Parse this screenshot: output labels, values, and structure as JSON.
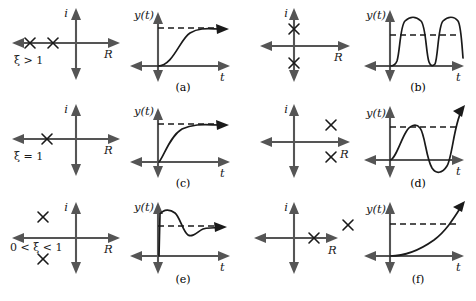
{
  "figure": {
    "axis_labels": {
      "real": "R",
      "imaginary": "i",
      "output": "y(t)",
      "time": "t"
    },
    "colors": {
      "axis": "#555555",
      "curve": "#1a1a1a",
      "text": "#1a1a1a",
      "background": "#ffffff"
    },
    "pole_glyph": "x"
  },
  "panels": [
    {
      "id": "a",
      "caption": "(a)",
      "damping_label": "ξ > 1",
      "damping_condition": "overdamped",
      "row": 0,
      "column": 0,
      "poles": {
        "description": "two distinct real poles on the negative real axis",
        "count": 2,
        "points": [
          {
            "real": -0.82,
            "imag": 0.0
          },
          {
            "real": -0.45,
            "imag": 0.0
          }
        ]
      },
      "response": {
        "description": "non-oscillatory exponential rise to the steady state value",
        "type": "overdamped-step",
        "overshoot": false,
        "reference_line": true,
        "final_value": 1.0
      }
    },
    {
      "id": "b",
      "caption": "(b)",
      "damping_label": "",
      "damping_condition": "undamped",
      "row": 0,
      "column": 1,
      "poles": {
        "description": "complex conjugate pair located on the imaginary axis",
        "count": 2,
        "points": [
          {
            "real": 0.0,
            "imag": 0.5
          },
          {
            "real": 0.0,
            "imag": -0.5
          }
        ]
      },
      "response": {
        "description": "sustained oscillation of constant amplitude about the reference level",
        "type": "undamped-oscillation",
        "overshoot": true,
        "reference_line": true,
        "final_value": 1.0
      }
    },
    {
      "id": "c",
      "caption": "(c)",
      "damping_label": "ξ = 1",
      "damping_condition": "critically damped",
      "row": 1,
      "column": 0,
      "poles": {
        "description": "repeated real pole on the negative real axis",
        "count": 1,
        "points": [
          {
            "real": -0.55,
            "imag": 0.0
          }
        ]
      },
      "response": {
        "description": "fastest non-oscillatory rise to the steady state value",
        "type": "critically-damped-step",
        "overshoot": false,
        "reference_line": true,
        "final_value": 1.0
      }
    },
    {
      "id": "d",
      "caption": "(d)",
      "damping_label": "",
      "damping_condition": "unstable oscillatory",
      "row": 1,
      "column": 1,
      "poles": {
        "description": "complex conjugate pair in the right half plane",
        "count": 2,
        "points": [
          {
            "real": 0.55,
            "imag": 0.45
          },
          {
            "real": 0.55,
            "imag": -0.45
          }
        ]
      },
      "response": {
        "description": "oscillation with exponentially growing amplitude",
        "type": "growing-oscillation",
        "overshoot": true,
        "reference_line": true,
        "final_value": 1.0
      }
    },
    {
      "id": "e",
      "caption": "(e)",
      "damping_label": "0 < ξ < 1",
      "damping_condition": "underdamped",
      "row": 2,
      "column": 0,
      "poles": {
        "description": "complex conjugate pair in the left half plane",
        "count": 2,
        "points": [
          {
            "real": -0.55,
            "imag": 0.5
          },
          {
            "real": -0.55,
            "imag": -0.5
          }
        ]
      },
      "response": {
        "description": "damped oscillation decaying onto the steady state value",
        "type": "damped-oscillation",
        "overshoot": true,
        "reference_line": true,
        "final_value": 1.0
      }
    },
    {
      "id": "f",
      "caption": "(f)",
      "damping_label": "",
      "damping_condition": "unstable real",
      "row": 2,
      "column": 1,
      "poles": {
        "description": "two real poles on the positive real axis",
        "count": 2,
        "points": [
          {
            "real": 0.4,
            "imag": 0.0
          },
          {
            "real": 0.95,
            "imag": 0.22
          }
        ]
      },
      "response": {
        "description": "monotonically growing exponential crossing the reference level",
        "type": "growing-exponential",
        "overshoot": true,
        "reference_line": true,
        "final_value": 1.0
      }
    }
  ]
}
